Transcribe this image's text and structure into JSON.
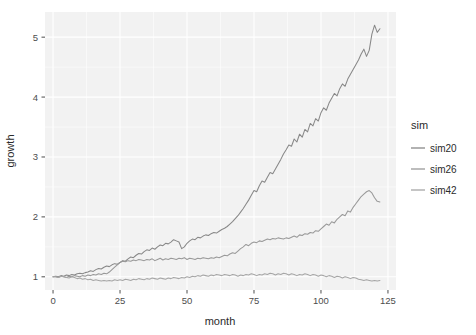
{
  "chart_data": {
    "type": "line",
    "title": "",
    "xlabel": "month",
    "ylabel": "growth",
    "xlim": [
      -3,
      128
    ],
    "ylim": [
      0.78,
      5.42
    ],
    "xticks": [
      0,
      25,
      50,
      75,
      100,
      125
    ],
    "yticks": [
      1,
      2,
      3,
      4,
      5
    ],
    "xtick_labels": [
      "0",
      "25",
      "50",
      "75",
      "100",
      "125"
    ],
    "ytick_labels": [
      "1",
      "2",
      "3",
      "4",
      "5"
    ],
    "grid": true,
    "grid_color": "#ffffff",
    "panel_color": "#f2f2f2",
    "legend": {
      "title": "sim",
      "position": "right",
      "entries": [
        "sim20",
        "sim26",
        "sim42"
      ]
    },
    "x": [
      0,
      1,
      2,
      3,
      4,
      5,
      6,
      7,
      8,
      9,
      10,
      11,
      12,
      13,
      14,
      15,
      16,
      17,
      18,
      19,
      20,
      21,
      22,
      23,
      24,
      25,
      26,
      27,
      28,
      29,
      30,
      31,
      32,
      33,
      34,
      35,
      36,
      37,
      38,
      39,
      40,
      41,
      42,
      43,
      44,
      45,
      46,
      47,
      48,
      49,
      50,
      51,
      52,
      53,
      54,
      55,
      56,
      57,
      58,
      59,
      60,
      61,
      62,
      63,
      64,
      65,
      66,
      67,
      68,
      69,
      70,
      71,
      72,
      73,
      74,
      75,
      76,
      77,
      78,
      79,
      80,
      81,
      82,
      83,
      84,
      85,
      86,
      87,
      88,
      89,
      90,
      91,
      92,
      93,
      94,
      95,
      96,
      97,
      98,
      99,
      100,
      101,
      102,
      103,
      104,
      105,
      106,
      107,
      108,
      109,
      110,
      111,
      112,
      113,
      114,
      115,
      116,
      117,
      118,
      119,
      120,
      121,
      122
    ],
    "series": [
      {
        "name": "sim20",
        "color": "#888888",
        "values": [
          1.0,
          1.01,
          1.0,
          1.02,
          1.01,
          1.03,
          1.02,
          1.04,
          1.03,
          1.05,
          1.06,
          1.05,
          1.07,
          1.08,
          1.1,
          1.09,
          1.12,
          1.14,
          1.13,
          1.16,
          1.18,
          1.17,
          1.2,
          1.22,
          1.21,
          1.24,
          1.27,
          1.26,
          1.3,
          1.33,
          1.32,
          1.36,
          1.39,
          1.38,
          1.42,
          1.45,
          1.44,
          1.48,
          1.46,
          1.5,
          1.53,
          1.52,
          1.56,
          1.55,
          1.58,
          1.62,
          1.6,
          1.58,
          1.47,
          1.5,
          1.56,
          1.6,
          1.63,
          1.62,
          1.66,
          1.65,
          1.68,
          1.7,
          1.69,
          1.72,
          1.74,
          1.73,
          1.76,
          1.79,
          1.81,
          1.84,
          1.88,
          1.92,
          1.97,
          2.02,
          2.08,
          2.14,
          2.21,
          2.28,
          2.36,
          2.44,
          2.42,
          2.52,
          2.6,
          2.58,
          2.66,
          2.74,
          2.72,
          2.8,
          2.88,
          2.96,
          3.05,
          3.12,
          3.2,
          3.18,
          3.3,
          3.25,
          3.38,
          3.33,
          3.46,
          3.42,
          3.56,
          3.52,
          3.64,
          3.6,
          3.74,
          3.82,
          3.78,
          3.9,
          3.98,
          4.06,
          4.02,
          4.14,
          4.22,
          4.18,
          4.3,
          4.38,
          4.46,
          4.54,
          4.62,
          4.72,
          4.8,
          4.68,
          4.78,
          5.05,
          5.2,
          5.08,
          5.14
        ]
      },
      {
        "name": "sim26",
        "color": "#999999",
        "values": [
          1.0,
          1.0,
          0.99,
          1.01,
          1.0,
          0.99,
          1.01,
          1.0,
          1.02,
          1.01,
          1.0,
          1.02,
          1.01,
          1.03,
          1.02,
          1.04,
          1.03,
          1.05,
          1.04,
          1.06,
          1.05,
          1.08,
          1.12,
          1.16,
          1.2,
          1.24,
          1.26,
          1.25,
          1.27,
          1.26,
          1.28,
          1.27,
          1.29,
          1.28,
          1.27,
          1.29,
          1.28,
          1.3,
          1.27,
          1.29,
          1.31,
          1.28,
          1.3,
          1.29,
          1.31,
          1.3,
          1.29,
          1.31,
          1.3,
          1.32,
          1.29,
          1.31,
          1.3,
          1.29,
          1.31,
          1.3,
          1.32,
          1.31,
          1.3,
          1.32,
          1.31,
          1.33,
          1.32,
          1.34,
          1.36,
          1.35,
          1.38,
          1.4,
          1.39,
          1.43,
          1.47,
          1.5,
          1.54,
          1.52,
          1.56,
          1.58,
          1.57,
          1.6,
          1.59,
          1.61,
          1.63,
          1.62,
          1.64,
          1.63,
          1.65,
          1.64,
          1.63,
          1.65,
          1.64,
          1.66,
          1.68,
          1.66,
          1.7,
          1.69,
          1.72,
          1.71,
          1.74,
          1.73,
          1.77,
          1.76,
          1.8,
          1.84,
          1.88,
          1.86,
          1.92,
          1.9,
          1.96,
          2.0,
          2.04,
          2.02,
          2.1,
          2.08,
          2.16,
          2.22,
          2.28,
          2.34,
          2.38,
          2.42,
          2.44,
          2.4,
          2.32,
          2.26,
          2.25
        ]
      },
      {
        "name": "sim42",
        "color": "#a6a6a6",
        "values": [
          1.0,
          1.0,
          0.99,
          1.01,
          1.0,
          0.99,
          0.98,
          1.0,
          0.99,
          0.97,
          0.98,
          0.96,
          0.97,
          0.95,
          0.96,
          0.94,
          0.95,
          0.94,
          0.93,
          0.94,
          0.93,
          0.94,
          0.93,
          0.95,
          0.94,
          0.95,
          0.94,
          0.96,
          0.95,
          0.94,
          0.96,
          0.95,
          0.97,
          0.96,
          0.95,
          0.97,
          0.96,
          0.98,
          0.97,
          0.96,
          0.98,
          0.97,
          0.96,
          0.98,
          0.97,
          0.99,
          0.98,
          0.97,
          0.99,
          0.98,
          1.0,
          0.99,
          1.01,
          1.0,
          1.02,
          1.01,
          1.03,
          1.02,
          1.01,
          1.03,
          1.02,
          1.04,
          1.03,
          1.02,
          1.04,
          1.03,
          1.02,
          1.04,
          1.03,
          1.01,
          1.03,
          1.02,
          1.04,
          1.03,
          1.05,
          1.04,
          1.02,
          1.04,
          1.03,
          1.05,
          1.04,
          1.06,
          1.05,
          1.03,
          1.05,
          1.04,
          1.06,
          1.05,
          1.03,
          1.05,
          1.04,
          1.02,
          1.04,
          1.03,
          1.05,
          1.04,
          1.02,
          1.04,
          1.03,
          1.01,
          1.03,
          1.02,
          1.0,
          1.02,
          1.01,
          0.99,
          1.01,
          1.0,
          0.98,
          1.0,
          0.99,
          0.97,
          0.99,
          0.98,
          0.96,
          0.95,
          0.94,
          0.95,
          0.94,
          0.93,
          0.94,
          0.93,
          0.94
        ]
      }
    ]
  }
}
